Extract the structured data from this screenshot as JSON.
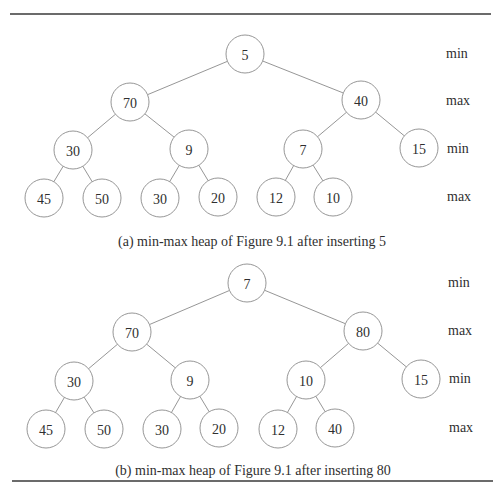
{
  "figure": {
    "rules": [
      {
        "x1": 10,
        "x2": 491,
        "y": 14
      },
      {
        "x1": 12,
        "x2": 493,
        "y": 481
      }
    ],
    "node_radius": 19,
    "panels": [
      {
        "id": "a",
        "caption": "(a) min-max heap of Figure 9.1 after inserting 5",
        "caption_pos": {
          "x": 252,
          "y": 241
        },
        "level_labels": [
          {
            "text": "min",
            "x": 446,
            "y": 53
          },
          {
            "text": "max",
            "x": 446,
            "y": 100
          },
          {
            "text": "min",
            "x": 447,
            "y": 148
          },
          {
            "text": "max",
            "x": 447,
            "y": 196
          }
        ],
        "nodes": [
          {
            "value": "5",
            "x": 245,
            "y": 54
          },
          {
            "value": "70",
            "x": 130,
            "y": 102
          },
          {
            "value": "40",
            "x": 361,
            "y": 100
          },
          {
            "value": "30",
            "x": 73,
            "y": 150
          },
          {
            "value": "9",
            "x": 189,
            "y": 149
          },
          {
            "value": "7",
            "x": 303,
            "y": 149
          },
          {
            "value": "15",
            "x": 419,
            "y": 148
          },
          {
            "value": "45",
            "x": 44,
            "y": 198
          },
          {
            "value": "50",
            "x": 102,
            "y": 198
          },
          {
            "value": "30",
            "x": 160,
            "y": 198
          },
          {
            "value": "20",
            "x": 218,
            "y": 197
          },
          {
            "value": "12",
            "x": 276,
            "y": 197
          },
          {
            "value": "10",
            "x": 333,
            "y": 197
          }
        ],
        "edges": [
          [
            0,
            1
          ],
          [
            0,
            2
          ],
          [
            1,
            3
          ],
          [
            1,
            4
          ],
          [
            2,
            5
          ],
          [
            2,
            6
          ],
          [
            3,
            7
          ],
          [
            3,
            8
          ],
          [
            4,
            9
          ],
          [
            4,
            10
          ],
          [
            5,
            11
          ],
          [
            5,
            12
          ]
        ]
      },
      {
        "id": "b",
        "caption": "(b) min-max heap of Figure 9.1 after inserting 80",
        "caption_pos": {
          "x": 253,
          "y": 470
        },
        "level_labels": [
          {
            "text": "min",
            "x": 448,
            "y": 282
          },
          {
            "text": "max",
            "x": 448,
            "y": 330
          },
          {
            "text": "min",
            "x": 449,
            "y": 378
          },
          {
            "text": "max",
            "x": 449,
            "y": 427
          }
        ],
        "nodes": [
          {
            "value": "7",
            "x": 247,
            "y": 283
          },
          {
            "value": "70",
            "x": 132,
            "y": 332
          },
          {
            "value": "80",
            "x": 363,
            "y": 331
          },
          {
            "value": "30",
            "x": 74,
            "y": 381
          },
          {
            "value": "9",
            "x": 190,
            "y": 380
          },
          {
            "value": "10",
            "x": 306,
            "y": 380
          },
          {
            "value": "15",
            "x": 421,
            "y": 379
          },
          {
            "value": "45",
            "x": 46,
            "y": 429
          },
          {
            "value": "50",
            "x": 104,
            "y": 429
          },
          {
            "value": "30",
            "x": 162,
            "y": 429
          },
          {
            "value": "20",
            "x": 219,
            "y": 428
          },
          {
            "value": "12",
            "x": 278,
            "y": 429
          },
          {
            "value": "40",
            "x": 335,
            "y": 428
          }
        ],
        "edges": [
          [
            0,
            1
          ],
          [
            0,
            2
          ],
          [
            1,
            3
          ],
          [
            1,
            4
          ],
          [
            2,
            5
          ],
          [
            2,
            6
          ],
          [
            3,
            7
          ],
          [
            3,
            8
          ],
          [
            4,
            9
          ],
          [
            4,
            10
          ],
          [
            5,
            11
          ],
          [
            5,
            12
          ]
        ]
      }
    ]
  }
}
